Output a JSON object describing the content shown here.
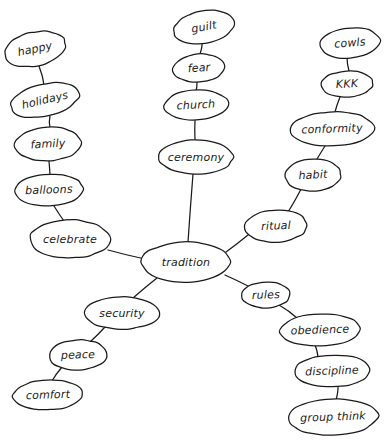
{
  "diagram": {
    "type": "concept-map",
    "background_color": "#ffffff",
    "stroke_color": "#1a1a1a",
    "center_node": "tradition",
    "nodes": [
      {
        "id": "happy",
        "label": "happy",
        "cx": 35,
        "cy": 49,
        "rx": 31,
        "ry": 17,
        "rot": -12,
        "fs": 11
      },
      {
        "id": "holidays",
        "label": "holidays",
        "cx": 45,
        "cy": 100,
        "rx": 35,
        "ry": 16,
        "rot": -13,
        "fs": 11
      },
      {
        "id": "family",
        "label": "family",
        "cx": 48,
        "cy": 144,
        "rx": 33,
        "ry": 17,
        "rot": -3,
        "fs": 11
      },
      {
        "id": "balloons",
        "label": "balloons",
        "cx": 49,
        "cy": 190,
        "rx": 34,
        "ry": 16,
        "rot": -2,
        "fs": 11
      },
      {
        "id": "celebrate",
        "label": "celebrate",
        "cx": 70,
        "cy": 239,
        "rx": 40,
        "ry": 19,
        "rot": 0,
        "fs": 11
      },
      {
        "id": "guilt",
        "label": "guilt",
        "cx": 204,
        "cy": 27,
        "rx": 31,
        "ry": 16,
        "rot": -10,
        "fs": 11
      },
      {
        "id": "fear",
        "label": "fear",
        "cx": 199,
        "cy": 68,
        "rx": 26,
        "ry": 14,
        "rot": -4,
        "fs": 11
      },
      {
        "id": "church",
        "label": "church",
        "cx": 196,
        "cy": 105,
        "rx": 32,
        "ry": 15,
        "rot": -3,
        "fs": 11
      },
      {
        "id": "ceremony",
        "label": "ceremony",
        "cx": 196,
        "cy": 157,
        "rx": 37,
        "ry": 17,
        "rot": 0,
        "fs": 11
      },
      {
        "id": "cowls",
        "label": "cowls",
        "cx": 350,
        "cy": 43,
        "rx": 30,
        "ry": 15,
        "rot": -5,
        "fs": 11
      },
      {
        "id": "kkk",
        "label": "KKK",
        "cx": 347,
        "cy": 84,
        "rx": 26,
        "ry": 13,
        "rot": -3,
        "fs": 11
      },
      {
        "id": "conformity",
        "label": "conformity",
        "cx": 332,
        "cy": 129,
        "rx": 42,
        "ry": 17,
        "rot": -2,
        "fs": 11
      },
      {
        "id": "habit",
        "label": "habit",
        "cx": 313,
        "cy": 175,
        "rx": 28,
        "ry": 16,
        "rot": -3,
        "fs": 11
      },
      {
        "id": "ritual",
        "label": "ritual",
        "cx": 276,
        "cy": 226,
        "rx": 31,
        "ry": 16,
        "rot": -2,
        "fs": 11
      },
      {
        "id": "tradition",
        "label": "tradition",
        "cx": 186,
        "cy": 262,
        "rx": 44,
        "ry": 20,
        "rot": 0,
        "fs": 11
      },
      {
        "id": "security",
        "label": "security",
        "cx": 122,
        "cy": 313,
        "rx": 38,
        "ry": 16,
        "rot": 0,
        "fs": 11
      },
      {
        "id": "peace",
        "label": "peace",
        "cx": 78,
        "cy": 355,
        "rx": 29,
        "ry": 15,
        "rot": -2,
        "fs": 11
      },
      {
        "id": "comfort",
        "label": "comfort",
        "cx": 48,
        "cy": 395,
        "rx": 35,
        "ry": 15,
        "rot": -2,
        "fs": 11
      },
      {
        "id": "rules",
        "label": "rules",
        "cx": 266,
        "cy": 295,
        "rx": 24,
        "ry": 13,
        "rot": -2,
        "fs": 11
      },
      {
        "id": "obedience",
        "label": "obedience",
        "cx": 320,
        "cy": 330,
        "rx": 40,
        "ry": 16,
        "rot": -2,
        "fs": 11
      },
      {
        "id": "discipline",
        "label": "discipline",
        "cx": 332,
        "cy": 371,
        "rx": 38,
        "ry": 16,
        "rot": -2,
        "fs": 11
      },
      {
        "id": "groupthink",
        "label": "group think",
        "cx": 333,
        "cy": 417,
        "rx": 45,
        "ry": 18,
        "rot": -2,
        "fs": 11
      }
    ],
    "edges": [
      {
        "from": "happy",
        "to": "holidays",
        "x1": 39,
        "y1": 66,
        "x2": 44,
        "y2": 85
      },
      {
        "from": "holidays",
        "to": "family",
        "x1": 50,
        "y1": 116,
        "x2": 50,
        "y2": 128
      },
      {
        "from": "family",
        "to": "balloons",
        "x1": 49,
        "y1": 161,
        "x2": 50,
        "y2": 175
      },
      {
        "from": "balloons",
        "to": "celebrate",
        "x1": 54,
        "y1": 206,
        "x2": 64,
        "y2": 221
      },
      {
        "from": "celebrate",
        "to": "tradition",
        "x1": 108,
        "y1": 250,
        "x2": 145,
        "y2": 259
      },
      {
        "from": "guilt",
        "to": "fear",
        "x1": 202,
        "y1": 43,
        "x2": 200,
        "y2": 54
      },
      {
        "from": "fear",
        "to": "church",
        "x1": 197,
        "y1": 82,
        "x2": 196,
        "y2": 91
      },
      {
        "from": "church",
        "to": "ceremony",
        "x1": 195,
        "y1": 120,
        "x2": 195,
        "y2": 140
      },
      {
        "from": "ceremony",
        "to": "tradition",
        "x1": 193,
        "y1": 174,
        "x2": 188,
        "y2": 242
      },
      {
        "from": "cowls",
        "to": "kkk",
        "x1": 347,
        "y1": 58,
        "x2": 349,
        "y2": 71
      },
      {
        "from": "kkk",
        "to": "conformity",
        "x1": 340,
        "y1": 97,
        "x2": 335,
        "y2": 112
      },
      {
        "from": "conformity",
        "to": "habit",
        "x1": 325,
        "y1": 146,
        "x2": 317,
        "y2": 159
      },
      {
        "from": "habit",
        "to": "ritual",
        "x1": 301,
        "y1": 189,
        "x2": 288,
        "y2": 212
      },
      {
        "from": "ritual",
        "to": "tradition",
        "x1": 248,
        "y1": 235,
        "x2": 226,
        "y2": 252
      },
      {
        "from": "tradition",
        "to": "security",
        "x1": 157,
        "y1": 278,
        "x2": 133,
        "y2": 298
      },
      {
        "from": "security",
        "to": "peace",
        "x1": 105,
        "y1": 327,
        "x2": 90,
        "y2": 342
      },
      {
        "from": "peace",
        "to": "comfort",
        "x1": 62,
        "y1": 367,
        "x2": 52,
        "y2": 381
      },
      {
        "from": "tradition",
        "to": "rules",
        "x1": 225,
        "y1": 275,
        "x2": 250,
        "y2": 287
      },
      {
        "from": "rules",
        "to": "obedience",
        "x1": 279,
        "y1": 305,
        "x2": 297,
        "y2": 318
      },
      {
        "from": "obedience",
        "to": "discipline",
        "x1": 315,
        "y1": 345,
        "x2": 318,
        "y2": 357
      },
      {
        "from": "discipline",
        "to": "groupthink",
        "x1": 338,
        "y1": 386,
        "x2": 336,
        "y2": 400
      }
    ]
  }
}
